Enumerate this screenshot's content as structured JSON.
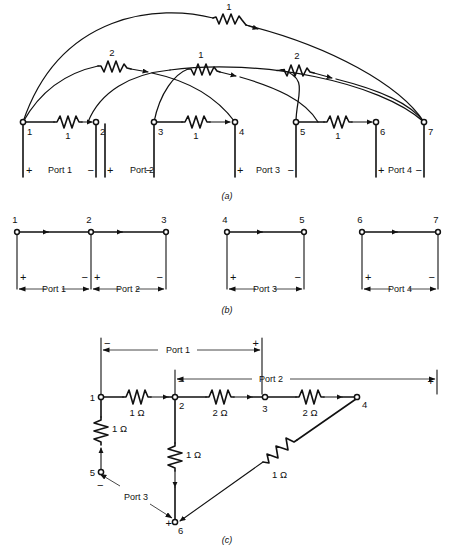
{
  "figure": {
    "panels": [
      {
        "id": "a",
        "label": "(a)"
      },
      {
        "id": "b",
        "label": "(b)"
      },
      {
        "id": "c",
        "label": "(c)"
      }
    ]
  },
  "panel_a": {
    "node_labels": [
      "1",
      "2",
      "3",
      "4",
      "5",
      "6",
      "7"
    ],
    "horizontal_branches": [
      {
        "from": "1",
        "to": "2",
        "value": "1"
      },
      {
        "from": "3",
        "to": "4",
        "value": "1"
      },
      {
        "from": "5",
        "to": "6",
        "value": "1"
      }
    ],
    "arc_branches": [
      {
        "from": "1",
        "to": "7",
        "value": "1"
      },
      {
        "from": "1",
        "to": "4",
        "value": "2"
      },
      {
        "from": "3",
        "to": "6",
        "value": "1"
      },
      {
        "from": "2",
        "to": "7",
        "value": "2"
      },
      {
        "from": "5",
        "to": "7",
        "value": "2"
      }
    ],
    "ports": [
      {
        "name": "Port 1",
        "plus": "+",
        "minus": "−"
      },
      {
        "name": "Port 2",
        "plus": "+",
        "minus": "−"
      },
      {
        "name": "Port 3",
        "plus": "+",
        "minus": "−"
      },
      {
        "name": "Port 4",
        "plus": "+",
        "minus": "−"
      }
    ]
  },
  "panel_b": {
    "groups": [
      {
        "nodes": [
          "1",
          "2",
          "3"
        ],
        "ports": [
          {
            "name": "Port 1",
            "plus": "+",
            "minus": "−"
          },
          {
            "name": "Port 2",
            "plus": "+",
            "minus": "−"
          }
        ]
      },
      {
        "nodes": [
          "4",
          "5"
        ],
        "ports": [
          {
            "name": "Port 3",
            "plus": "+",
            "minus": "−"
          }
        ]
      },
      {
        "nodes": [
          "6",
          "7"
        ],
        "ports": [
          {
            "name": "Port 4",
            "plus": "+",
            "minus": "−"
          }
        ]
      }
    ]
  },
  "panel_c": {
    "node_labels": [
      "1",
      "2",
      "3",
      "4",
      "5",
      "6"
    ],
    "branches": [
      {
        "from": "1",
        "to": "2",
        "value": "1 Ω"
      },
      {
        "from": "2",
        "to": "3",
        "value": "2 Ω"
      },
      {
        "from": "3",
        "to": "4",
        "value": "2 Ω"
      },
      {
        "from": "5",
        "to": "1",
        "value": "1 Ω"
      },
      {
        "from": "2",
        "to": "6",
        "value": "1 Ω"
      },
      {
        "from": "4",
        "to": "6",
        "value": "1 Ω"
      }
    ],
    "ports": [
      {
        "name": "Port 1",
        "minus": "−",
        "plus": "+"
      },
      {
        "name": "Port 2",
        "minus": "−",
        "plus": "+"
      },
      {
        "name": "Port 3",
        "minus": "−",
        "plus": "+"
      }
    ]
  }
}
